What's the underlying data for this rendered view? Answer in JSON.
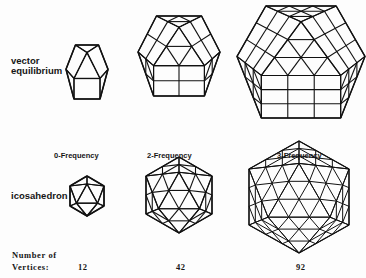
{
  "rows": {
    "vector_equilibrium": {
      "label_line1": "vector",
      "label_line2": "equilibrium"
    },
    "icosahedron": {
      "label": "icosahedron"
    }
  },
  "frequencies": [
    {
      "label": "0-Frequency"
    },
    {
      "label": "2-Frequency"
    },
    {
      "label": "3-Frequency"
    }
  ],
  "vertices": {
    "label_line1": "Number of",
    "label_line2": "Vertices:",
    "counts": [
      "12",
      "42",
      "92"
    ]
  },
  "figures": [
    {
      "id": "ve-0",
      "shape": "vector-equilibrium",
      "frequency": 0
    },
    {
      "id": "ve-2",
      "shape": "vector-equilibrium",
      "frequency": 2
    },
    {
      "id": "ve-3",
      "shape": "vector-equilibrium",
      "frequency": 3
    },
    {
      "id": "ico-0",
      "shape": "icosahedron",
      "frequency": 0
    },
    {
      "id": "ico-2",
      "shape": "icosahedron",
      "frequency": 2
    },
    {
      "id": "ico-3",
      "shape": "icosahedron",
      "frequency": 3
    }
  ],
  "colors": {
    "ink": "#111111",
    "paper": "#fdfdfd"
  }
}
